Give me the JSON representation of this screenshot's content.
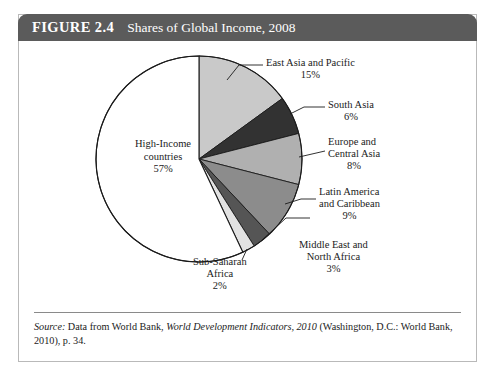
{
  "figure": {
    "number_label": "FIGURE 2.4",
    "title": "Shares of Global Income, 2008"
  },
  "source": {
    "label": "Source:",
    "text_part1": " Data from World Bank, ",
    "text_italic": "World Development Indicators, 2010",
    "text_part2": " (Washington, D.C.: World Bank, 2010), p. 34."
  },
  "chart_data": {
    "type": "pie",
    "title": "Shares of Global Income, 2008",
    "unit": "%",
    "start_angle_deg": 0,
    "direction": "clockwise",
    "legend": "none",
    "grid": false,
    "categories": [
      "East Asia and Pacific",
      "South Asia",
      "Europe and Central Asia",
      "Latin America and Caribbean",
      "Middle East and North Africa",
      "Sub-Saharan Africa",
      "High-Income countries"
    ],
    "values": [
      15,
      6,
      8,
      9,
      3,
      2,
      57
    ],
    "colors": [
      "#c9c9c9",
      "#323232",
      "#b0b0b0",
      "#8c8c8c",
      "#555555",
      "#e2e2e2",
      "#ffffff"
    ],
    "slices": [
      {
        "name": "East Asia and Pacific",
        "value": 15,
        "value_label": "15%",
        "color": "#c9c9c9"
      },
      {
        "name": "South Asia",
        "value": 6,
        "value_label": "6%",
        "color": "#323232"
      },
      {
        "name": "Europe and Central Asia",
        "value": 8,
        "value_label": "8%",
        "color": "#b0b0b0"
      },
      {
        "name": "Latin America and Caribbean",
        "value": 9,
        "value_label": "9%",
        "color": "#8c8c8c"
      },
      {
        "name": "Middle East and North Africa",
        "value": 3,
        "value_label": "3%",
        "color": "#555555"
      },
      {
        "name": "Sub-Saharan Africa",
        "value": 2,
        "value_label": "2%",
        "color": "#e2e2e2"
      },
      {
        "name": "High-Income countries",
        "value": 57,
        "value_label": "57%",
        "color": "#ffffff"
      }
    ]
  },
  "labels": {
    "east_asia_line1": "East Asia and Pacific",
    "east_asia_line2": "15%",
    "south_asia_line1": "South Asia",
    "south_asia_line2": "6%",
    "europe_line1": "Europe and",
    "europe_line2": "Central Asia",
    "europe_line3": "8%",
    "latin_line1": "Latin America",
    "latin_line2": "and Caribbean",
    "latin_line3": "9%",
    "mideast_line1": "Middle East and",
    "mideast_line2": "North Africa",
    "mideast_line3": "3%",
    "subsaharan_line1": "Sub-Saharan",
    "subsaharan_line2": "Africa",
    "subsaharan_line3": "2%",
    "highincome_line1": "High-Income",
    "highincome_line2": "countries",
    "highincome_line3": "57%"
  }
}
